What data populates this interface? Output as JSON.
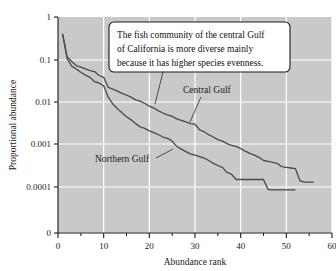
{
  "chart_data": {
    "type": "line",
    "title": "",
    "xlabel": "Abundance rank",
    "ylabel": "Proportional abundance",
    "xlim": [
      0,
      60
    ],
    "xticks": [
      0,
      10,
      20,
      30,
      40,
      50,
      60
    ],
    "xtick_labels": [
      "0",
      "10",
      "20",
      "30",
      "40",
      "50",
      "60"
    ],
    "x_minor_ticks": [
      5,
      15,
      25,
      35,
      45,
      55
    ],
    "yscale": "log",
    "ytick_labels": [
      "1",
      "0.1",
      "0.01",
      "0.001",
      "0.0001",
      "0"
    ],
    "ytick_values": [
      1,
      0.1,
      0.01,
      0.001,
      0.0001,
      0
    ],
    "grid": true,
    "grid_color": "#ffffff",
    "plot_background": "#c9c9c9",
    "line_color": "#4a4a4a",
    "legend_position": "inline-annotation",
    "annotation": {
      "lines": [
        "The fish community of the central Gulf",
        "of California is more diverse mainly",
        "because it has higher species evenness."
      ]
    },
    "series": [
      {
        "name": "Central Gulf",
        "label": "Central Gulf",
        "x": [
          1,
          2,
          3,
          4,
          5,
          6,
          7,
          8,
          9,
          10,
          11,
          12,
          13,
          14,
          15,
          16,
          17,
          18,
          19,
          20,
          21,
          22,
          23,
          24,
          25,
          26,
          27,
          28,
          29,
          30,
          31,
          32,
          33,
          34,
          35,
          36,
          37,
          38,
          39,
          40,
          41,
          42,
          43,
          44,
          45,
          46,
          47,
          48,
          49,
          50,
          51,
          52,
          53,
          54,
          55,
          56
        ],
        "y": [
          0.4,
          0.115,
          0.09,
          0.072,
          0.066,
          0.06,
          0.055,
          0.052,
          0.042,
          0.038,
          0.022,
          0.02,
          0.018,
          0.016,
          0.0145,
          0.013,
          0.0112,
          0.0105,
          0.0092,
          0.008,
          0.0072,
          0.0062,
          0.0055,
          0.005,
          0.0046,
          0.004,
          0.0037,
          0.0034,
          0.0031,
          0.003,
          0.0022,
          0.002,
          0.0017,
          0.0015,
          0.0013,
          0.0012,
          0.00105,
          0.00095,
          0.0009,
          0.0008,
          0.0007,
          0.00062,
          0.00056,
          0.0005,
          0.00042,
          0.0004,
          0.00038,
          0.00036,
          0.0003,
          0.00029,
          0.00028,
          0.00027,
          0.00014,
          0.00013,
          0.00013,
          0.00013
        ]
      },
      {
        "name": "Northern Gulf",
        "label": "Northern Gulf",
        "x": [
          1,
          2,
          3,
          4,
          5,
          6,
          7,
          8,
          9,
          10,
          11,
          12,
          13,
          14,
          15,
          16,
          17,
          18,
          19,
          20,
          21,
          22,
          23,
          24,
          25,
          26,
          27,
          28,
          29,
          30,
          31,
          32,
          33,
          34,
          35,
          36,
          37,
          38,
          39,
          40,
          41,
          42,
          43,
          44,
          45,
          46,
          47,
          48,
          49,
          50,
          51,
          52
        ],
        "y": [
          0.4,
          0.105,
          0.07,
          0.06,
          0.05,
          0.043,
          0.038,
          0.03,
          0.028,
          0.024,
          0.013,
          0.009,
          0.007,
          0.0056,
          0.0045,
          0.0038,
          0.0031,
          0.0026,
          0.0024,
          0.0021,
          0.0019,
          0.0017,
          0.0015,
          0.0014,
          0.0012,
          0.0009,
          0.00078,
          0.00068,
          0.0006,
          0.00056,
          0.00052,
          0.00048,
          0.00042,
          0.00036,
          0.00032,
          0.00029,
          0.00022,
          0.0002,
          0.00015,
          0.00015,
          0.00015,
          0.00015,
          0.00015,
          0.00015,
          0.00015,
          8.8e-05,
          8.6e-05,
          8.6e-05,
          8.6e-05,
          8.6e-05,
          8.6e-05,
          8.6e-05
        ]
      }
    ]
  }
}
